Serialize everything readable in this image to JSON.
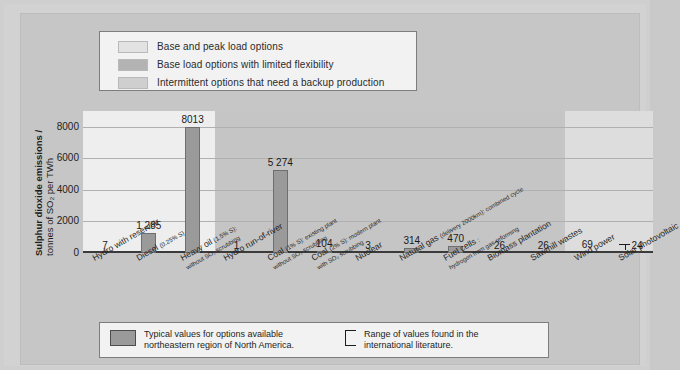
{
  "top_legend": {
    "items": [
      {
        "label": "Base and peak load options",
        "color": "#e2e2e2",
        "swatch_name": "swatch-base-peak"
      },
      {
        "label": "Base load options with limited flexibility",
        "color": "#b3b3b3",
        "swatch_name": "swatch-base-limited"
      },
      {
        "label": "Intermittent options that need a backup production",
        "color": "#cfcfcf",
        "swatch_name": "swatch-intermittent"
      }
    ]
  },
  "bottom_legend": {
    "typical_swatch_color": "#9a9a9a",
    "typical_text_line1": "Typical values for options available",
    "typical_text_line2": "northeastern region of North America.",
    "range_text_line1": "Range of values found in the",
    "range_text_line2": "international literature."
  },
  "chart_data": {
    "type": "bar",
    "title": "",
    "ylabel_line1": "Sulphur dioxide emissions /",
    "ylabel_line2": "tonnes of SO₂ per TWh",
    "xlabel": "",
    "ylim": [
      0,
      9000
    ],
    "yticks": [
      "0",
      "2000",
      "4000",
      "6000",
      "8000"
    ],
    "ytick_values": [
      0,
      2000,
      4000,
      6000,
      8000
    ],
    "grid": true,
    "legend_position": "top",
    "bar_color": "#9a9a9a",
    "categories": [
      "Hydro with reservoir",
      "Diesel (0.25% S)",
      "Heavy oil (1.5% S): without SO2 scrubbing",
      "Hydro run-of-river",
      "Coal (1% S): existing plant without SO2 scrubbing",
      "Coal (2% S): modern plant with SO2 scrubbing",
      "Nuclear",
      "Natural gas (delivery 2000km): combined cycle",
      "Fuel cells: hydrogen from gas reforming",
      "Biomass plantation",
      "Sawmill wastes",
      "Wind power",
      "Solar photovoltaic"
    ],
    "values": [
      7,
      1285,
      8013,
      1,
      5274,
      104,
      3,
      314,
      470,
      26,
      26,
      69,
      24
    ],
    "value_labels": [
      "7",
      "1 285",
      "8013",
      "1",
      "5 274",
      "104",
      "3",
      "314",
      "470",
      "26",
      "26",
      "69",
      "24"
    ],
    "has_range_bracket": [
      false,
      false,
      false,
      false,
      false,
      false,
      false,
      false,
      false,
      false,
      false,
      false,
      true
    ],
    "background_bands": [
      {
        "name": "base-and-peak-load",
        "color": "#eeeeee",
        "start_index": 0,
        "end_index": 2
      },
      {
        "name": "base-load-limited-flexibility",
        "color": "#c5c5c5",
        "start_index": 3,
        "end_index": 10
      },
      {
        "name": "intermittent-backup",
        "color": "#dddddd",
        "start_index": 11,
        "end_index": 12
      }
    ],
    "category_labels": [
      {
        "main": "Hydro with reservoir",
        "sub": ""
      },
      {
        "main": "Diesel",
        "paren": "(0.25% S)",
        "sub": ""
      },
      {
        "main": "Heavy oil",
        "paren": "(1.5% S):",
        "sub": "without SO₂ scrubbing"
      },
      {
        "main": "Hydro run-of-river",
        "sub": ""
      },
      {
        "main": "Coal",
        "paren": "(1% S): existing plant",
        "sub": "without SO₂ scrubbing"
      },
      {
        "main": "Coal",
        "paren": "(2% S): modern plant",
        "sub": "with SO₂ scrubbing"
      },
      {
        "main": "Nuclear",
        "sub": ""
      },
      {
        "main": "Natural gas",
        "paren": "(delivery 2000km): combined cycle",
        "sub": ""
      },
      {
        "main": "Fuel cells",
        "paren": ":",
        "sub": "hydrogen from gas reforming"
      },
      {
        "main": "Biomass plantation",
        "sub": ""
      },
      {
        "main": "Sawmill wastes",
        "sub": ""
      },
      {
        "main": "Wind power",
        "sub": ""
      },
      {
        "main": "Solar photovoltaic",
        "sub": ""
      }
    ]
  }
}
